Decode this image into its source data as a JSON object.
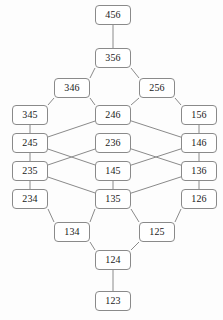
{
  "diagram": {
    "type": "hasse-lattice",
    "title": "",
    "node_width": 36,
    "node_height": 20,
    "colors": {
      "node_border": "#8a8a8a",
      "node_fill": "#ffffff",
      "edge": "#8a8a8a",
      "text": "#1a1a1a",
      "background": "#fdfdfd"
    },
    "nodes": [
      {
        "id": "456",
        "label": "456",
        "x": 95,
        "y": 5
      },
      {
        "id": "356",
        "label": "356",
        "x": 95,
        "y": 48
      },
      {
        "id": "346",
        "label": "346",
        "x": 54,
        "y": 78
      },
      {
        "id": "256",
        "label": "256",
        "x": 139,
        "y": 78
      },
      {
        "id": "345",
        "label": "345",
        "x": 12,
        "y": 105
      },
      {
        "id": "246",
        "label": "246",
        "x": 95,
        "y": 105
      },
      {
        "id": "156",
        "label": "156",
        "x": 181,
        "y": 105
      },
      {
        "id": "245",
        "label": "245",
        "x": 12,
        "y": 133
      },
      {
        "id": "236",
        "label": "236",
        "x": 95,
        "y": 133
      },
      {
        "id": "146",
        "label": "146",
        "x": 181,
        "y": 133
      },
      {
        "id": "235",
        "label": "235",
        "x": 12,
        "y": 161
      },
      {
        "id": "145",
        "label": "145",
        "x": 95,
        "y": 161
      },
      {
        "id": "136",
        "label": "136",
        "x": 181,
        "y": 161
      },
      {
        "id": "234",
        "label": "234",
        "x": 12,
        "y": 189
      },
      {
        "id": "135",
        "label": "135",
        "x": 95,
        "y": 189
      },
      {
        "id": "126",
        "label": "126",
        "x": 181,
        "y": 189
      },
      {
        "id": "134",
        "label": "134",
        "x": 54,
        "y": 222
      },
      {
        "id": "125",
        "label": "125",
        "x": 139,
        "y": 222
      },
      {
        "id": "124",
        "label": "124",
        "x": 95,
        "y": 250
      },
      {
        "id": "123",
        "label": "123",
        "x": 95,
        "y": 291
      }
    ],
    "edges": [
      {
        "from": "456",
        "to": "356"
      },
      {
        "from": "356",
        "to": "346"
      },
      {
        "from": "356",
        "to": "256"
      },
      {
        "from": "346",
        "to": "345"
      },
      {
        "from": "346",
        "to": "246"
      },
      {
        "from": "256",
        "to": "246"
      },
      {
        "from": "256",
        "to": "156"
      },
      {
        "from": "345",
        "to": "245"
      },
      {
        "from": "246",
        "to": "245"
      },
      {
        "from": "246",
        "to": "146"
      },
      {
        "from": "156",
        "to": "146"
      },
      {
        "from": "245",
        "to": "235"
      },
      {
        "from": "245",
        "to": "145"
      },
      {
        "from": "236",
        "to": "235"
      },
      {
        "from": "236",
        "to": "136"
      },
      {
        "from": "146",
        "to": "145"
      },
      {
        "from": "146",
        "to": "136"
      },
      {
        "from": "235",
        "to": "234"
      },
      {
        "from": "235",
        "to": "135"
      },
      {
        "from": "145",
        "to": "135"
      },
      {
        "from": "136",
        "to": "135"
      },
      {
        "from": "136",
        "to": "126"
      },
      {
        "from": "234",
        "to": "134"
      },
      {
        "from": "135",
        "to": "134"
      },
      {
        "from": "135",
        "to": "125"
      },
      {
        "from": "126",
        "to": "125"
      },
      {
        "from": "134",
        "to": "124"
      },
      {
        "from": "125",
        "to": "124"
      },
      {
        "from": "124",
        "to": "123"
      }
    ]
  }
}
